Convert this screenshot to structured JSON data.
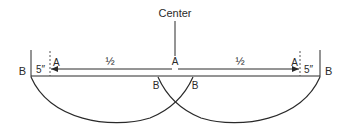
{
  "diagram": {
    "center_label": "Center",
    "labels": {
      "a_left": "A",
      "a_center": "A",
      "a_right": "A",
      "b_left": "B",
      "b_right": "B",
      "b_inner_left": "B",
      "b_inner_right": "B",
      "half_left": "½",
      "half_right": "½",
      "five_left": "5″",
      "five_right": "5″"
    },
    "colors": {
      "stroke": "#2a2a2a",
      "dashed": "#555555",
      "background": "#ffffff"
    }
  }
}
